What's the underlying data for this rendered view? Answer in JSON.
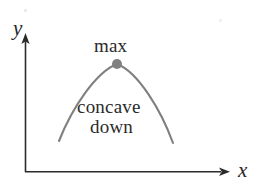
{
  "figure": {
    "background_color": "#ffffff"
  },
  "axes": {
    "y_axis": {
      "label": "y",
      "color": "#2b2b2b",
      "origin_x": 25,
      "top_y": 36,
      "bottom_y": 172,
      "arrow": "up"
    },
    "x_axis": {
      "label": "x",
      "color": "#2b2b2b",
      "origin_y": 172,
      "left_x": 25,
      "right_x": 230,
      "arrow": "right"
    }
  },
  "curve": {
    "name": "parabola",
    "color": "#808080",
    "stroke_width": 2,
    "concavity": "down",
    "left_endpoint": [
      59,
      141
    ],
    "vertex": [
      117,
      64
    ],
    "right_endpoint": [
      173,
      143
    ]
  },
  "vertex_point": {
    "label": "max",
    "color": "#808080",
    "radius": 5,
    "cx": 117,
    "cy": 64
  },
  "annotations": {
    "max_label": "max",
    "concave_line1": "concave",
    "concave_line2": "down"
  },
  "chart_data": {
    "type": "line",
    "title": "",
    "xlabel": "x",
    "ylabel": "y",
    "grid": false,
    "legend": false,
    "annotations": [
      "max",
      "concave",
      "down"
    ],
    "series": [
      {
        "name": "concave down parabola",
        "x": [
          59,
          66,
          74,
          82,
          90,
          99,
          108,
          117,
          126,
          135,
          144,
          152,
          160,
          167,
          173
        ],
        "y": [
          141,
          123,
          108,
          95,
          85,
          76,
          69,
          64,
          65,
          70,
          79,
          91,
          106,
          124,
          143
        ]
      }
    ],
    "points": [
      {
        "label": "max",
        "x": 117,
        "y": 64
      }
    ]
  }
}
